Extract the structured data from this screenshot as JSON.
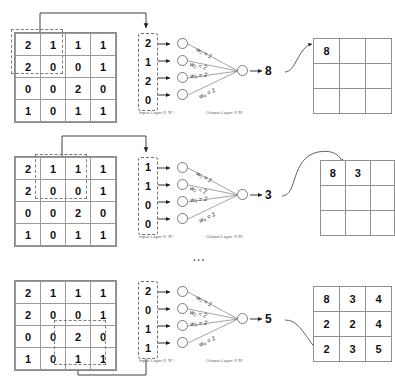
{
  "diagram": {
    "ellipsis": "...",
    "colors": {
      "ink": "#111111",
      "grid_line": "#9a9a9a",
      "dashed": "#7d7d7d",
      "label_gray": "#5d5d5d"
    }
  },
  "labels": {
    "input_layer": "Input Layer ∈ ℜ⁴",
    "output_layer": "Output Layer ∈ ℜ¹"
  },
  "weights": [
    {
      "name": "w1",
      "text": "w₁ = 1"
    },
    {
      "name": "w2",
      "text": "w₂ = 2"
    },
    {
      "name": "w3",
      "text": "w₃ = 2"
    },
    {
      "name": "w4",
      "text": "w₄ = 1"
    }
  ],
  "source_matrix": {
    "rows": 4,
    "cols": 4,
    "values": [
      [
        "2",
        "1",
        "1",
        "1"
      ],
      [
        "2",
        "0",
        "0",
        "1"
      ],
      [
        "0",
        "0",
        "2",
        "0"
      ],
      [
        "1",
        "0",
        "1",
        "1"
      ]
    ]
  },
  "steps": [
    {
      "id": "step-1",
      "window_position": "top-left",
      "input_vector": [
        "2",
        "1",
        "2",
        "0"
      ],
      "output_value": "8",
      "feature_map": [
        [
          "8",
          "",
          ""
        ],
        [
          "",
          "",
          ""
        ],
        [
          "",
          "",
          ""
        ]
      ]
    },
    {
      "id": "step-2",
      "window_position": "top-middle",
      "input_vector": [
        "1",
        "1",
        "0",
        "0"
      ],
      "output_value": "3",
      "feature_map": [
        [
          "8",
          "3",
          ""
        ],
        [
          "",
          "",
          ""
        ],
        [
          "",
          "",
          ""
        ]
      ]
    },
    {
      "id": "step-3",
      "window_position": "bottom-right",
      "input_vector": [
        "2",
        "0",
        "1",
        "1"
      ],
      "output_value": "5",
      "feature_map": [
        [
          "8",
          "3",
          "4"
        ],
        [
          "2",
          "2",
          "4"
        ],
        [
          "2",
          "3",
          "5"
        ]
      ]
    }
  ]
}
